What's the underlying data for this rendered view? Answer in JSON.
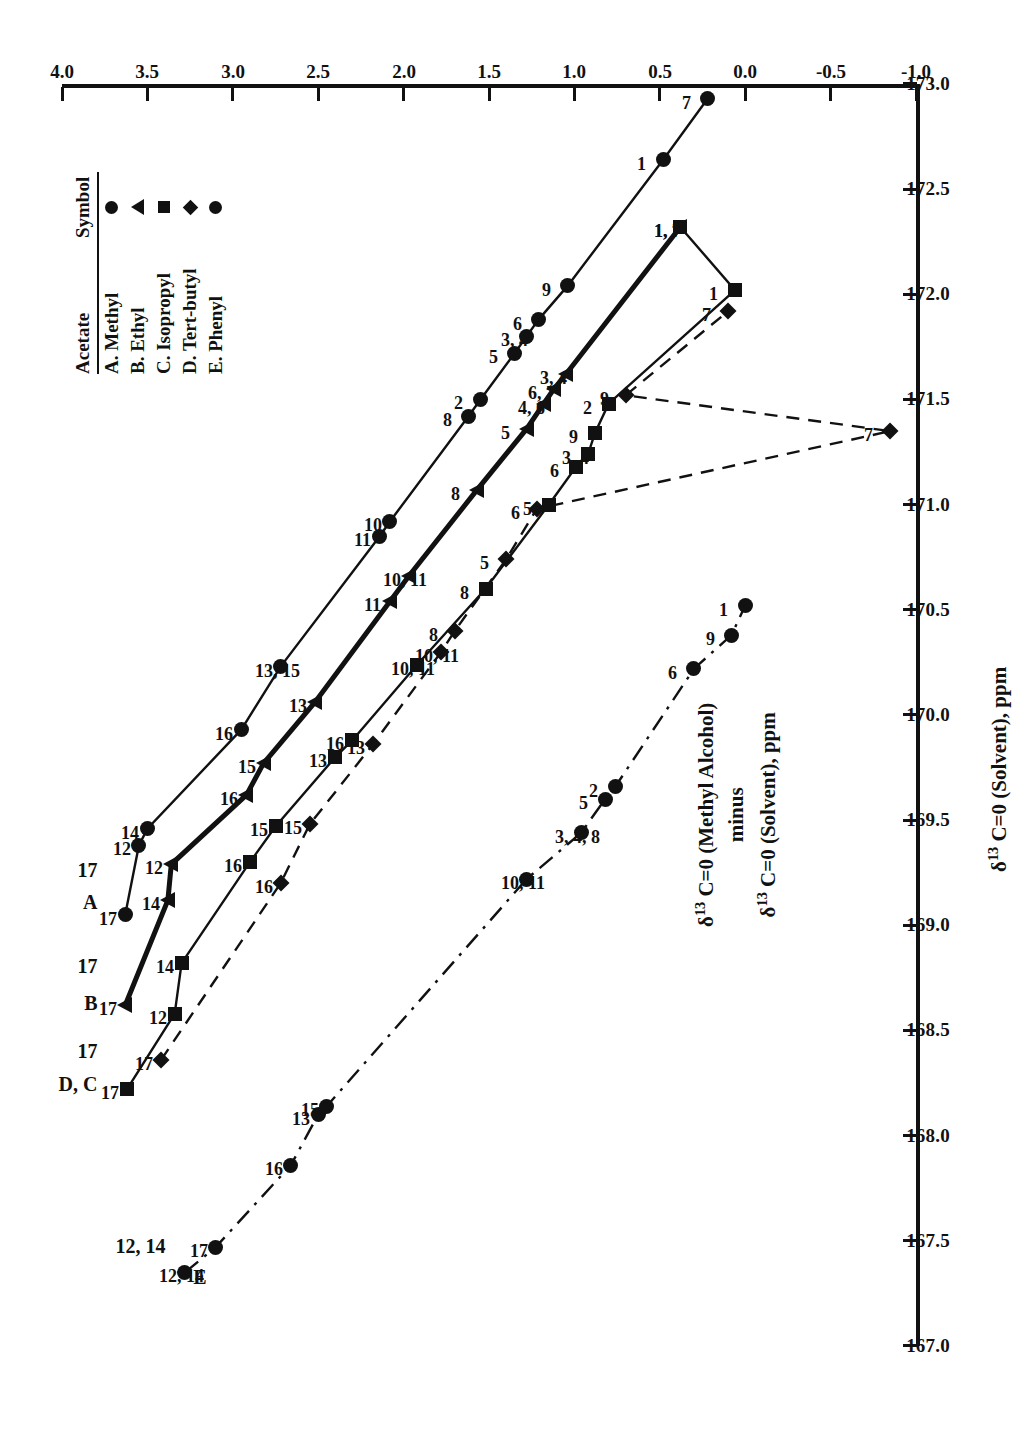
{
  "chart_data": {
    "type": "line",
    "title": "",
    "xlabel": "δ13 C=0 (Solvent), ppm",
    "ylabel": "δ13 C=0 (Methyl Alcohol) minus δ13 C=0 (Solvent), ppm",
    "xlim": [
      167.0,
      173.0
    ],
    "ylim": [
      -1.0,
      4.0
    ],
    "xticks": [
      "167.0",
      "167.5",
      "168.0",
      "168.5",
      "169.0",
      "169.5",
      "170.0",
      "170.5",
      "171.0",
      "171.5",
      "172.0",
      "172.5",
      "173.0"
    ],
    "yticks": [
      "-1.0",
      "-0.5",
      "0.0",
      "0.5",
      "1.0",
      "1.5",
      "2.0",
      "2.5",
      "3.0",
      "3.5",
      "4.0"
    ],
    "grid": false,
    "legend_position": "top-right",
    "orientation": "page rotated 90 degrees (landscape plot on portrait page)",
    "series": [
      {
        "name": "A. Methyl",
        "key": "A",
        "symbol": "circle",
        "linestyle": "solid",
        "series_label": "A",
        "points": [
          {
            "label": "17",
            "x": 169.05,
            "y": 3.63
          },
          {
            "label": "12",
            "x": 169.38,
            "y": 3.55
          },
          {
            "label": "14",
            "x": 169.46,
            "y": 3.5
          },
          {
            "label": "16",
            "x": 169.93,
            "y": 2.95
          },
          {
            "label": "13, 15",
            "x": 170.23,
            "y": 2.72
          },
          {
            "label": "11",
            "x": 170.85,
            "y": 2.14
          },
          {
            "label": "10",
            "x": 170.92,
            "y": 2.08
          },
          {
            "label": "8",
            "x": 171.42,
            "y": 1.62
          },
          {
            "label": "2",
            "x": 171.5,
            "y": 1.55
          },
          {
            "label": "5",
            "x": 171.72,
            "y": 1.35
          },
          {
            "label": "3, 4",
            "x": 171.8,
            "y": 1.28
          },
          {
            "label": "6",
            "x": 171.88,
            "y": 1.21
          },
          {
            "label": "9",
            "x": 172.04,
            "y": 1.04
          },
          {
            "label": "1",
            "x": 172.64,
            "y": 0.48
          },
          {
            "label": "7",
            "x": 172.93,
            "y": 0.22
          }
        ]
      },
      {
        "name": "B. Ethyl",
        "key": "B",
        "symbol": "triangle",
        "linestyle": "solid-bold",
        "series_label": "B",
        "points": [
          {
            "label": "17",
            "x": 168.62,
            "y": 3.63
          },
          {
            "label": "14",
            "x": 169.12,
            "y": 3.38
          },
          {
            "label": "12",
            "x": 169.29,
            "y": 3.36
          },
          {
            "label": "16",
            "x": 169.62,
            "y": 2.92
          },
          {
            "label": "15",
            "x": 169.77,
            "y": 2.82
          },
          {
            "label": "13",
            "x": 170.06,
            "y": 2.52
          },
          {
            "label": "11",
            "x": 170.54,
            "y": 2.08
          },
          {
            "label": "10, 11",
            "x": 170.66,
            "y": 1.97
          },
          {
            "label": "8",
            "x": 171.07,
            "y": 1.57
          },
          {
            "label": "5",
            "x": 171.36,
            "y": 1.28
          },
          {
            "label": "4, 6",
            "x": 171.48,
            "y": 1.18
          },
          {
            "label": "6, 7",
            "x": 171.55,
            "y": 1.12
          },
          {
            "label": "3, 4",
            "x": 171.62,
            "y": 1.05
          },
          {
            "label": "1, 7",
            "x": 172.32,
            "y": 0.38
          }
        ]
      },
      {
        "name": "C. Isopropyl",
        "key": "C",
        "symbol": "square",
        "linestyle": "solid",
        "series_label": "D, C",
        "points": [
          {
            "label": "17",
            "x": 168.22,
            "y": 3.62
          },
          {
            "label": "12",
            "x": 168.58,
            "y": 3.34
          },
          {
            "label": "14",
            "x": 168.82,
            "y": 3.3
          },
          {
            "label": "16",
            "x": 169.3,
            "y": 2.9
          },
          {
            "label": "15",
            "x": 169.47,
            "y": 2.75
          },
          {
            "label": "13",
            "x": 169.8,
            "y": 2.4
          },
          {
            "label": "16",
            "x": 169.88,
            "y": 2.3
          },
          {
            "label": "10, 11",
            "x": 170.24,
            "y": 1.92
          },
          {
            "label": "8",
            "x": 170.6,
            "y": 1.52
          },
          {
            "label": "5",
            "x": 171.0,
            "y": 1.15
          },
          {
            "label": "6",
            "x": 171.18,
            "y": 0.99
          },
          {
            "label": "3, 4",
            "x": 171.24,
            "y": 0.92
          },
          {
            "label": "9",
            "x": 171.34,
            "y": 0.88
          },
          {
            "label": "2",
            "x": 171.48,
            "y": 0.8
          },
          {
            "label": "1",
            "x": 172.02,
            "y": 0.06
          },
          {
            "label": "1, 7",
            "x": 172.32,
            "y": 0.38
          }
        ]
      },
      {
        "name": "D. Tert-butyl",
        "key": "D",
        "symbol": "diamond",
        "linestyle": "dashed",
        "series_label": "D, C",
        "points": [
          {
            "label": "17",
            "x": 168.36,
            "y": 3.42
          },
          {
            "label": "16",
            "x": 169.2,
            "y": 2.72
          },
          {
            "label": "15",
            "x": 169.48,
            "y": 2.55
          },
          {
            "label": "13",
            "x": 169.86,
            "y": 2.18
          },
          {
            "label": "10, 11",
            "x": 170.3,
            "y": 1.78
          },
          {
            "label": "8",
            "x": 170.4,
            "y": 1.7
          },
          {
            "label": "5",
            "x": 170.74,
            "y": 1.4
          },
          {
            "label": "6",
            "x": 170.98,
            "y": 1.22
          },
          {
            "label": "9",
            "x": 171.52,
            "y": 0.7
          },
          {
            "label": "7",
            "x": 171.92,
            "y": 0.1
          },
          {
            "label": "7",
            "x": 171.35,
            "y": -0.85
          }
        ]
      },
      {
        "name": "E. Phenyl",
        "key": "E",
        "symbol": "circle",
        "linestyle": "dash-dot",
        "series_label": "E",
        "points": [
          {
            "label": "12, 14",
            "x": 167.35,
            "y": 3.28
          },
          {
            "label": "17",
            "x": 167.47,
            "y": 3.1
          },
          {
            "label": "16",
            "x": 167.86,
            "y": 2.66
          },
          {
            "label": "13",
            "x": 168.1,
            "y": 2.5
          },
          {
            "label": "15",
            "x": 168.14,
            "y": 2.45
          },
          {
            "label": "10, 11",
            "x": 169.22,
            "y": 1.28
          },
          {
            "label": "3, 4, 8",
            "x": 169.44,
            "y": 0.96
          },
          {
            "label": "5",
            "x": 169.6,
            "y": 0.82
          },
          {
            "label": "2",
            "x": 169.66,
            "y": 0.76
          },
          {
            "label": "6",
            "x": 170.22,
            "y": 0.3
          },
          {
            "label": "9",
            "x": 170.38,
            "y": 0.08
          },
          {
            "label": "1",
            "x": 170.52,
            "y": 0.0
          }
        ]
      }
    ]
  },
  "legend": {
    "header_acetate": "Acetate",
    "header_symbol": "Symbol",
    "rows": [
      {
        "label": "A. Methyl",
        "symbol": "circle"
      },
      {
        "label": "B. Ethyl",
        "symbol": "triangle"
      },
      {
        "label": "C. Isopropyl",
        "symbol": "square"
      },
      {
        "label": "D. Tert-butyl",
        "symbol": "diamond"
      },
      {
        "label": "E. Phenyl",
        "symbol": "circle"
      }
    ]
  },
  "axes": {
    "x_title_parts": {
      "delta": "δ",
      "sup": "13",
      "rest": " C=0 (Solvent), ppm"
    },
    "y_title_line1_delta": "δ",
    "y_title_line1_sup": "13",
    "y_title_line1_rest": " C=0 (Methyl Alcohol)",
    "y_title_line2": "minus",
    "y_title_line3_delta": "δ",
    "y_title_line3_sup": "13",
    "y_title_line3_rest": " C=0 (Solvent), ppm"
  },
  "series_annotations": [
    {
      "text": "A",
      "x": 169.02,
      "y": 3.86
    },
    {
      "text": "B",
      "x": 168.54,
      "y": 3.86
    },
    {
      "text": "D, C",
      "x": 168.1,
      "y": 3.86
    },
    {
      "text": "E",
      "x": 167.24,
      "y": 3.22
    },
    {
      "text": "17",
      "x": 169.16,
      "y": 3.86
    },
    {
      "text": "17",
      "x": 168.7,
      "y": 3.86
    },
    {
      "text": "17",
      "x": 168.3,
      "y": 3.86
    },
    {
      "text": "12, 14",
      "x": 167.3,
      "y": 3.46
    }
  ],
  "colors": {
    "ink": "#111111",
    "background": "#ffffff"
  }
}
